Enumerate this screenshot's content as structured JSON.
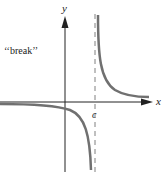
{
  "figure": {
    "annotation": "‘‘break’’",
    "x_axis_label": "x",
    "y_axis_label": "y",
    "asymptote_label": "c",
    "colors": {
      "axis": "#222222",
      "curve": "#707070",
      "asymptote": "#808080"
    }
  }
}
